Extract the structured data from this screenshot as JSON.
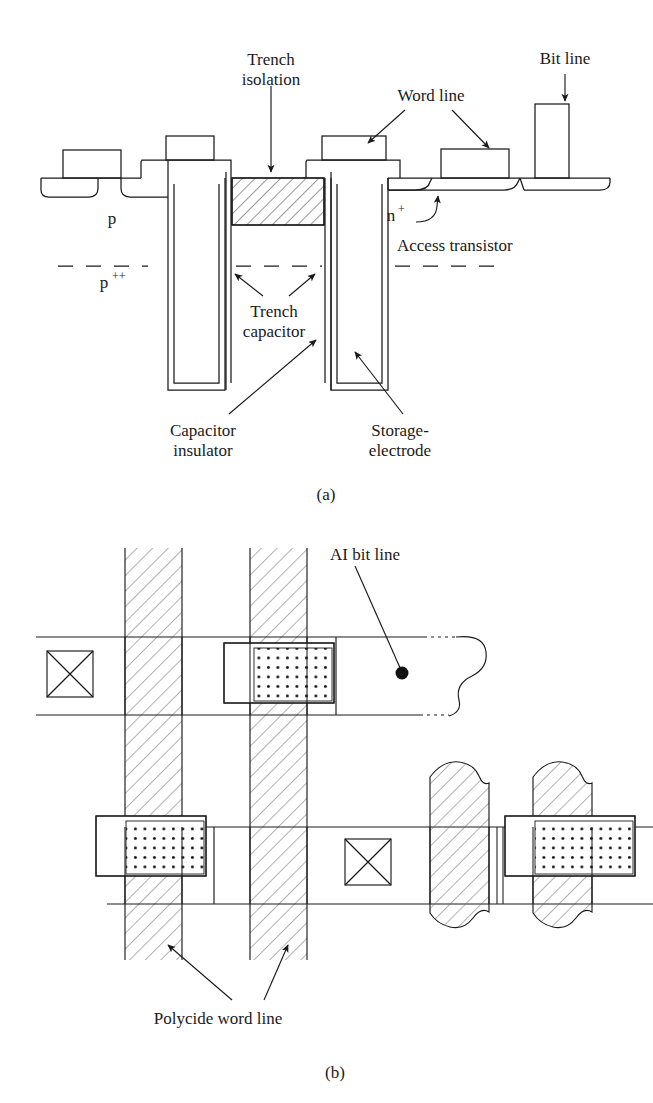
{
  "figure": {
    "kind": "trench-capacitor-dram-cell",
    "panels": [
      {
        "id": "a",
        "caption": "(a)",
        "caption_pos": {
          "x": 326,
          "y": 496
        },
        "description": "Cross-sectional view of trench capacitor DRAM cell",
        "labels": [
          {
            "name": "trench-isolation",
            "line1": "Trench",
            "line2": "isolation",
            "x": 271,
            "y": 72,
            "anchor": "middle"
          },
          {
            "name": "word-line",
            "line1": "Word line",
            "line2": "",
            "x": 431,
            "y": 99,
            "anchor": "middle"
          },
          {
            "name": "bit-line",
            "line1": "Bit line",
            "line2": "",
            "x": 565,
            "y": 64,
            "anchor": "middle"
          },
          {
            "name": "p-region",
            "line1": "p",
            "line2": "",
            "x": 112,
            "y": 220,
            "anchor": "middle"
          },
          {
            "name": "n-plus-region",
            "line1": "n",
            "line2": "",
            "x": 397,
            "y": 217,
            "anchor": "middle"
          },
          {
            "name": "access-transistor",
            "line1": "Access transistor",
            "line2": "",
            "x": 397,
            "y": 248,
            "anchor": "start"
          },
          {
            "name": "trench-capacitor",
            "line1": "Trench",
            "line2": "capacitor",
            "x": 274,
            "y": 310,
            "anchor": "middle"
          },
          {
            "name": "capacitor-insulator",
            "line1": "Capacitor",
            "line2": "insulator",
            "x": 203,
            "y": 436,
            "anchor": "middle"
          },
          {
            "name": "storage-electrode",
            "line1": "Storage-",
            "line2": "electrode",
            "x": 400,
            "y": 436,
            "anchor": "middle"
          }
        ],
        "superscripts": [
          {
            "name": "p-plus-plus-region",
            "base": "p",
            "sup": "++",
            "x": 112,
            "y": 283
          },
          {
            "name": "n-plus-superscript",
            "base": "n",
            "sup": "+",
            "x": 397,
            "y": 217
          }
        ]
      },
      {
        "id": "b",
        "caption": "(b)",
        "caption_pos": {
          "x": 335,
          "y": 1072
        },
        "description": "Plan (layout) view of the DRAM cell array",
        "labels": [
          {
            "name": "al-bit-line",
            "line1": "AI bit line",
            "line2": "",
            "x": 365,
            "y": 557,
            "anchor": "middle"
          },
          {
            "name": "polycide-word-line",
            "line1": "Polycide word line",
            "line2": "",
            "x": 218,
            "y": 1019,
            "anchor": "middle"
          }
        ]
      }
    ],
    "colors": {
      "stroke": "#1a1a1a",
      "hatch": "#555555",
      "dot": "#111111",
      "background": "#ffffff"
    }
  }
}
